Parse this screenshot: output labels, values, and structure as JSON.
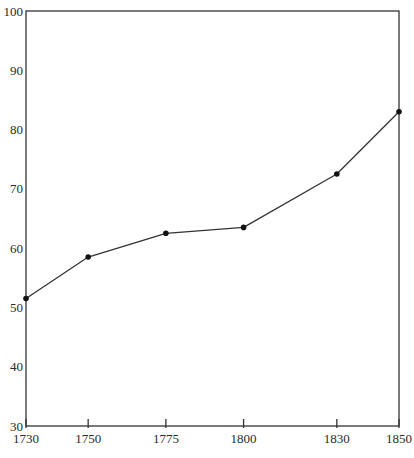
{
  "chart_data": {
    "type": "line",
    "title": "",
    "xlabel": "",
    "ylabel": "",
    "x": [
      1730,
      1750,
      1775,
      1800,
      1830,
      1850
    ],
    "categories": [
      "1730",
      "1750",
      "1775",
      "1800",
      "1830",
      "1850"
    ],
    "series": [
      {
        "name": "series-1",
        "values": [
          51.5,
          58.5,
          62.5,
          63.5,
          72.5,
          83
        ],
        "marker": "circle"
      }
    ],
    "xlim": [
      1730,
      1850
    ],
    "ylim": [
      30,
      100
    ],
    "x_ticks": [
      1730,
      1750,
      1775,
      1800,
      1830,
      1850
    ],
    "y_ticks": [
      30,
      40,
      50,
      60,
      70,
      80,
      90,
      100
    ],
    "grid": false,
    "legend": "none",
    "frame": "box"
  },
  "style": {
    "line_color": "#333333",
    "marker_color": "#111111",
    "axis_color": "#333333",
    "background": "#ffffff"
  }
}
